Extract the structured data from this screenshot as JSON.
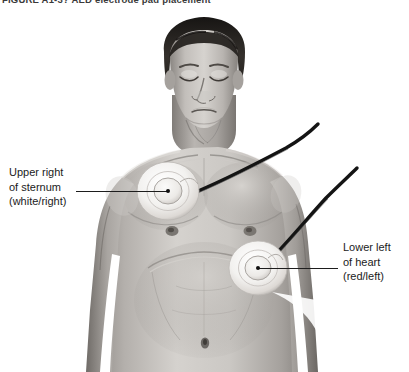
{
  "figure": {
    "caption": "FIGURE A1-3?  AED electrode pad placement",
    "caption_note": "clipped at top edge",
    "width": 409,
    "height": 372,
    "style": "grayscale pencil illustration",
    "background_color": "#ffffff"
  },
  "subject": {
    "description": "shirtless adult male torso, head tilted back, eyes closed",
    "skin_tone_light": "#d8d5d1",
    "skin_tone_mid": "#a8a39e",
    "skin_tone_shadow": "#6d6965",
    "hair_color": "#2a2724"
  },
  "labels": {
    "upper": {
      "line1": "Upper right",
      "line2": "of sternum",
      "line3": "(white/right)"
    },
    "lower": {
      "line1": "Lower left",
      "line2": "of heart",
      "line3": "(red/left)"
    }
  },
  "electrodes": [
    {
      "name": "upper-right-pad",
      "center_x": 168,
      "center_y": 191,
      "outer_radius": 30,
      "inner_radius": 14,
      "pad_color": "#f4f3f1",
      "connects_to": "upper"
    },
    {
      "name": "lower-left-pad",
      "center_x": 258,
      "center_y": 268,
      "outer_radius": 28,
      "inner_radius": 13,
      "pad_color": "#f4f3f1",
      "connects_to": "lower"
    }
  ],
  "cables": {
    "color": "#1a1a1a",
    "count": 2,
    "description": "two dark electrode cables entering from the upper right edge"
  },
  "leader_lines": {
    "color": "#1d1d1d"
  }
}
